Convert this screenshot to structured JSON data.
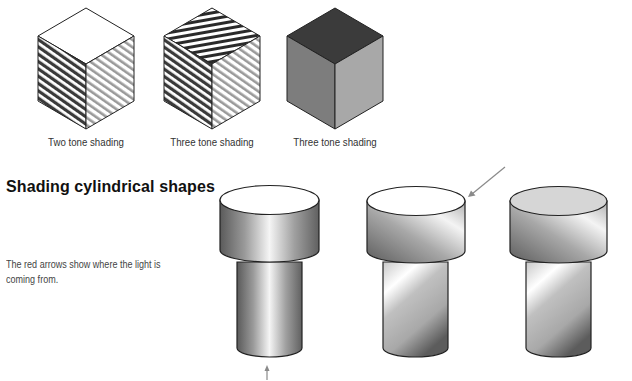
{
  "cubes": [
    {
      "id": "cube-two-tone",
      "caption": "Two tone shading",
      "style": "hatched",
      "faces": {
        "top": "#ffffff",
        "left": "#3a3a3a",
        "right": "#9a9a9a"
      }
    },
    {
      "id": "cube-three-tone-hatched",
      "caption": "Three tone shading",
      "style": "hatched",
      "faces": {
        "top": "#2a2a2a",
        "left": "#3a3a3a",
        "right": "#9a9a9a"
      }
    },
    {
      "id": "cube-three-tone-solid",
      "caption": "Three tone shading",
      "style": "solid",
      "faces": {
        "top": "#3b3b3b",
        "left": "#7d7d7d",
        "right": "#a8a8a8"
      }
    }
  ],
  "section": {
    "heading": "Shading cylindrical shapes",
    "description": "The red arrows show where the light is coming from."
  },
  "cylinders": [
    {
      "id": "cylinder-front-light",
      "light_direction": "from-front-bottom",
      "top_color": "#ffffff"
    },
    {
      "id": "cylinder-top-right-light",
      "light_direction": "from-top-right",
      "top_color": "#ffffff"
    },
    {
      "id": "cylinder-top-right-grey-top",
      "light_direction": "from-top-right",
      "top_color": "#d6d6d6"
    }
  ],
  "colors": {
    "outline": "#222222",
    "arrow": "#8a8a8a"
  }
}
